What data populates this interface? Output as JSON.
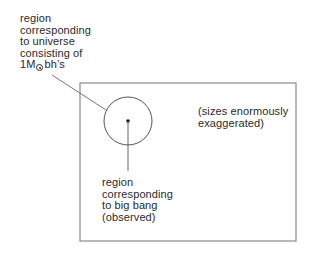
{
  "diagram": {
    "labels": {
      "universe_region": {
        "lines": [
          "region",
          "corresponding",
          "to universe",
          "consisting of"
        ],
        "last_line_prefix": "1M",
        "last_line_symbol": "sun-symbol",
        "last_line_suffix": "bh’s"
      },
      "big_bang_region": {
        "lines": [
          "region",
          "corresponding",
          "to big bang",
          "(observed)"
        ]
      },
      "note": {
        "lines": [
          "(sizes enormously",
          "exaggerated)"
        ]
      }
    },
    "shapes": {
      "frame": {
        "x": 80,
        "y": 83,
        "width": 216,
        "height": 158
      },
      "circle": {
        "cx": 128,
        "cy": 121,
        "r": 24
      },
      "dot": {
        "cx": 128,
        "cy": 121,
        "r": 1.8
      },
      "leader_universe": {
        "x1": 52,
        "y1": 75,
        "x2": 106,
        "y2": 110
      },
      "leader_big_bang": {
        "x1": 128,
        "y1": 121,
        "x2": 128,
        "y2": 171
      }
    },
    "colors": {
      "line": "#555555",
      "text": "#2a2a2a",
      "background": "#ffffff"
    }
  }
}
